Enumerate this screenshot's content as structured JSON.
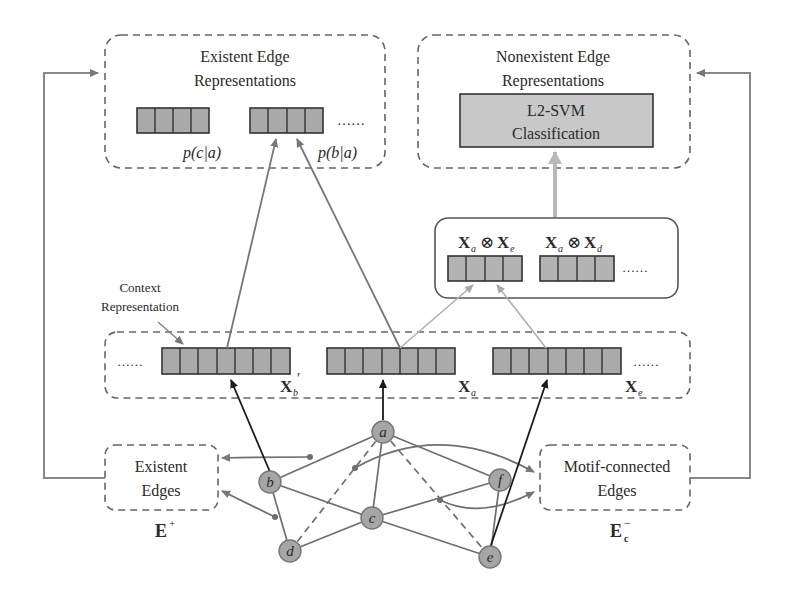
{
  "panels": {
    "existent_repr": {
      "title_line1": "Existent Edge",
      "title_line2": "Representations",
      "labels": [
        "p(c|a)",
        "p(b|a)"
      ],
      "ellipsis": "……"
    },
    "nonexistent_repr": {
      "title_line1": "Nonexistent Edge",
      "title_line2": "Representations",
      "classifier_line1": "L2-SVM",
      "classifier_line2": "Classification"
    },
    "products": {
      "items": [
        {
          "left": "X",
          "left_sub": "a",
          "op": "⊗",
          "right": "X",
          "right_sub": "e"
        },
        {
          "left": "X",
          "left_sub": "a",
          "op": "⊗",
          "right": "X",
          "right_sub": "d"
        }
      ],
      "ellipsis": "……"
    },
    "context": {
      "label_line1": "Context",
      "label_line2": "Representation",
      "vectors": [
        {
          "name": "X",
          "sub": "b",
          "prime": "′"
        },
        {
          "name": "X",
          "sub": "a",
          "prime": ""
        },
        {
          "name": "X",
          "sub": "e",
          "prime": ""
        }
      ],
      "ellipsis_left": "……",
      "ellipsis_right": "……"
    },
    "existent_edges": {
      "line1": "Existent",
      "line2": "Edges",
      "symbol": "E",
      "sup": "+"
    },
    "motif_edges": {
      "line1": "Motif-connected",
      "line2": "Edges",
      "symbol": "E",
      "sub": "c",
      "sup": "−"
    }
  },
  "graph": {
    "nodes": [
      "a",
      "b",
      "c",
      "d",
      "e",
      "f"
    ]
  },
  "colors": {
    "cell_fill": "#a9a9a9",
    "cell_fill_light": "#bdbdbd",
    "node_fill": "#a6a6a6",
    "edge": "#6e6e6e",
    "dashed_border": "#666666",
    "light_arrow": "#b5b5b5",
    "dark_arrow": "#1a1a1a"
  }
}
